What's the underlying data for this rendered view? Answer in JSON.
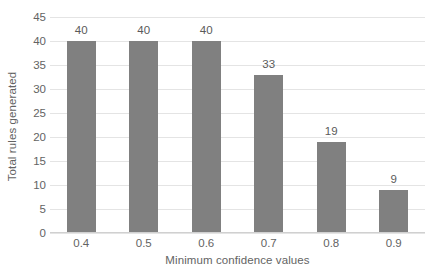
{
  "chart_data": {
    "type": "bar",
    "title": "",
    "subtitle": "",
    "xlabel": "Minimum confidence values",
    "ylabel": "Total rules generated",
    "categories": [
      "0.4",
      "0.5",
      "0.6",
      "0.7",
      "0.8",
      "0.9"
    ],
    "values": [
      40,
      40,
      40,
      33,
      19,
      9
    ],
    "data_labels": [
      "40",
      "40",
      "40",
      "33",
      "19",
      "9"
    ],
    "ylim": [
      0,
      45
    ],
    "ytick_step": 5,
    "ytick_labels": [
      "45",
      "40",
      "35",
      "30",
      "25",
      "20",
      "15",
      "10",
      "5",
      "0"
    ],
    "ytick_values": [
      45,
      40,
      35,
      30,
      25,
      20,
      15,
      10,
      5,
      0
    ],
    "grid": true,
    "grid_axis": "y",
    "legend": false,
    "legend_position": "none",
    "bar_color": "#808080",
    "grid_color": "#e4e4e4",
    "text_color": "#636363",
    "label_color": "#5a5a5a",
    "background_color": "#ffffff"
  }
}
